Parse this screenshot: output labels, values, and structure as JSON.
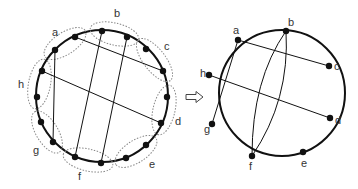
{
  "colors": {
    "stroke": "#111111",
    "dotted": "#888888",
    "label": "#333333",
    "background": "#ffffff"
  },
  "left_diagram": {
    "circle": {
      "cx": 102,
      "cy": 96,
      "r": 66
    },
    "groups": [
      {
        "label": "a",
        "points": [
          [
            55,
            50
          ],
          [
            75,
            37
          ]
        ],
        "label_pos": [
          52,
          36
        ]
      },
      {
        "label": "b",
        "points": [
          [
            102,
            31
          ],
          [
            127,
            37
          ]
        ],
        "label_pos": [
          114,
          17
        ]
      },
      {
        "label": "c",
        "points": [
          [
            146,
            49
          ],
          [
            163,
            71
          ]
        ],
        "label_pos": [
          164,
          50
        ]
      },
      {
        "label": "d",
        "points": [
          [
            167,
            97
          ],
          [
            161,
            123
          ]
        ],
        "label_pos": [
          175,
          125
        ]
      },
      {
        "label": "e",
        "points": [
          [
            146,
            145
          ],
          [
            126,
            158
          ]
        ],
        "label_pos": [
          149,
          168
        ]
      },
      {
        "label": "f",
        "points": [
          [
            101,
            163
          ],
          [
            75,
            157
          ]
        ],
        "label_pos": [
          78,
          180
        ]
      },
      {
        "label": "g",
        "points": [
          [
            53,
            142
          ],
          [
            41,
            122
          ]
        ],
        "label_pos": [
          33,
          154
        ]
      },
      {
        "label": "h",
        "points": [
          [
            37,
            97
          ],
          [
            42,
            71
          ]
        ],
        "label_pos": [
          18,
          88
        ]
      }
    ],
    "chords": [
      [
        [
          75,
          37
        ],
        [
          163,
          71
        ]
      ],
      [
        [
          42,
          71
        ],
        [
          161,
          123
        ]
      ],
      [
        [
          55,
          50
        ],
        [
          53,
          142
        ]
      ],
      [
        [
          102,
          31
        ],
        [
          75,
          157
        ]
      ],
      [
        [
          127,
          37
        ],
        [
          101,
          163
        ]
      ]
    ]
  },
  "arrow": {
    "symbol": "⟹",
    "x": 186,
    "y": 97
  },
  "right_diagram": {
    "circle": {
      "cx": 282,
      "cy": 93,
      "r": 63
    },
    "nodes": [
      {
        "label": "a",
        "pos": [
          238,
          40
        ],
        "label_pos": [
          233,
          34
        ]
      },
      {
        "label": "b",
        "pos": [
          286,
          31
        ],
        "label_pos": [
          288,
          26
        ]
      },
      {
        "label": "c",
        "pos": [
          329,
          66
        ],
        "label_pos": [
          334,
          70
        ]
      },
      {
        "label": "d",
        "pos": [
          330,
          118
        ],
        "label_pos": [
          335,
          124
        ]
      },
      {
        "label": "e",
        "pos": [
          303,
          152
        ],
        "label_pos": [
          301,
          167
        ]
      },
      {
        "label": "f",
        "pos": [
          252,
          156
        ],
        "label_pos": [
          249,
          170
        ]
      },
      {
        "label": "g",
        "pos": [
          212,
          124
        ],
        "label_pos": [
          204,
          133
        ]
      },
      {
        "label": "h",
        "pos": [
          209,
          75
        ],
        "label_pos": [
          200,
          77
        ]
      }
    ],
    "straight_chords": [
      [
        "a",
        "c"
      ],
      [
        "h",
        "d"
      ],
      [
        "a",
        "g"
      ]
    ],
    "curved_chords": [
      {
        "from": "b",
        "to": "f",
        "ctrl": [
          252,
          80
        ]
      },
      {
        "from": "b",
        "to": "f",
        "ctrl": [
          290,
          100
        ]
      }
    ]
  }
}
